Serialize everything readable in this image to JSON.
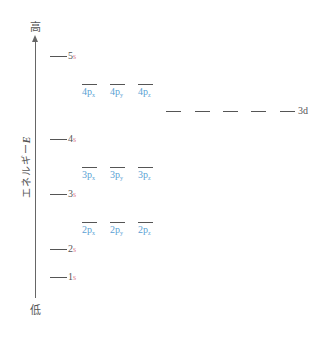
{
  "axis": {
    "top_label": "高",
    "bottom_label": "低",
    "title_text": "エネルギー",
    "title_var": "E"
  },
  "colors": {
    "s_orbital": "#e07f8f",
    "p_orbital": "#5a9fd4",
    "line": "#555555"
  },
  "s_levels": [
    {
      "n": "5",
      "sub": "s",
      "y": 56
    },
    {
      "n": "4",
      "sub": "s",
      "y": 139
    },
    {
      "n": "3",
      "sub": "s",
      "y": 194
    },
    {
      "n": "2",
      "sub": "s",
      "y": 249
    },
    {
      "n": "1",
      "sub": "s",
      "y": 277
    }
  ],
  "p_levels": [
    {
      "n": "4",
      "y": 84,
      "orbitals": [
        {
          "label": "4p",
          "sub": "x"
        },
        {
          "label": "4p",
          "sub": "y"
        },
        {
          "label": "4p",
          "sub": "z"
        }
      ]
    },
    {
      "n": "3",
      "y": 167,
      "orbitals": [
        {
          "label": "3p",
          "sub": "x"
        },
        {
          "label": "3p",
          "sub": "y"
        },
        {
          "label": "3p",
          "sub": "z"
        }
      ]
    },
    {
      "n": "2",
      "y": 222,
      "orbitals": [
        {
          "label": "2p",
          "sub": "x"
        },
        {
          "label": "2p",
          "sub": "y"
        },
        {
          "label": "2p",
          "sub": "z"
        }
      ]
    }
  ],
  "d_level": {
    "label": "3d",
    "y": 111,
    "count": 5
  }
}
